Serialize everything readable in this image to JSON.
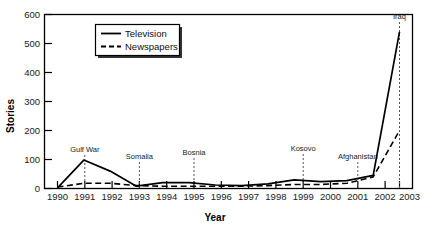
{
  "chart_data": {
    "type": "line",
    "title": "",
    "xlabel": "Year",
    "ylabel": "Stories",
    "grid": false,
    "legend_position": "top-center-left",
    "x": [
      1990,
      1991,
      1992,
      1993,
      1994,
      1995,
      1996,
      1997,
      1998,
      1999,
      2000,
      2001,
      2002,
      2003
    ],
    "xlim": [
      1990,
      2003
    ],
    "ylim": [
      0,
      600
    ],
    "yticks": [
      0,
      100,
      200,
      300,
      400,
      500,
      600
    ],
    "xticks": [
      "1990",
      "1991",
      "1992",
      "1993",
      "1994",
      "1995",
      "1996",
      "1997",
      "1998",
      "1999",
      "2000",
      "2001",
      "2002",
      "2003"
    ],
    "series": [
      {
        "name": "Television",
        "style": "solid",
        "values": [
          2,
          98,
          60,
          8,
          20,
          20,
          12,
          10,
          16,
          30,
          24,
          27,
          45,
          540
        ]
      },
      {
        "name": "Newspapers",
        "style": "dashed",
        "values": [
          5,
          18,
          18,
          10,
          8,
          8,
          8,
          8,
          10,
          14,
          14,
          18,
          40,
          200
        ]
      }
    ],
    "annotations": [
      {
        "label": "Gulf War",
        "year": 1991,
        "label_y": 150,
        "line_top": 155,
        "line_bottom": 188
      },
      {
        "label": "Somalia",
        "year": 1993,
        "label_y": 157,
        "line_top": 162,
        "line_bottom": 188
      },
      {
        "label": "Bosnia",
        "year": 1995,
        "label_y": 153,
        "line_top": 158,
        "line_bottom": 188
      },
      {
        "label": "Kosovo",
        "year": 1999,
        "label_y": 149,
        "line_top": 154,
        "line_bottom": 183
      },
      {
        "label": "Afghanistan",
        "year": 2001,
        "label_y": 157,
        "line_top": 162,
        "line_bottom": 186
      },
      {
        "label": "Iraq",
        "year": 2003,
        "label_y": 18,
        "line_top": 22,
        "line_bottom": 188
      }
    ]
  },
  "legend": {
    "items": [
      {
        "label": "Television",
        "style": "solid"
      },
      {
        "label": "Newspapers",
        "style": "dashed"
      }
    ]
  },
  "axes": {
    "y_title": "Stories",
    "x_title": "Year"
  },
  "colors": {
    "line": "#000000",
    "axis": "#000000",
    "text": "#1a1a1a",
    "annotation_line": "#555555",
    "legend_shadow": "#333333",
    "background": "#ffffff"
  }
}
